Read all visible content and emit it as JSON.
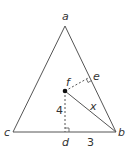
{
  "diagram": {
    "type": "geometry-figure",
    "colors": {
      "line": "#555555",
      "text": "#333333",
      "point": "#111111",
      "background": "#ffffff"
    },
    "points": {
      "a": {
        "label": "a",
        "x": 65,
        "y": 26
      },
      "b": {
        "label": "b",
        "x": 116,
        "y": 132
      },
      "c": {
        "label": "c",
        "x": 13,
        "y": 132
      },
      "d": {
        "label": "d",
        "x": 65,
        "y": 132
      },
      "e": {
        "label": "e",
        "x": 90,
        "y": 77
      },
      "f": {
        "label": "f",
        "x": 65,
        "y": 91
      }
    },
    "segments": {
      "fd": {
        "label": "4",
        "style": "dashed"
      },
      "db": {
        "label": "3",
        "style": "solid"
      },
      "fb": {
        "label": "x",
        "style": "solid"
      },
      "fe": {
        "label": "",
        "style": "dashed"
      }
    },
    "right_angles": [
      "d",
      "e"
    ]
  }
}
